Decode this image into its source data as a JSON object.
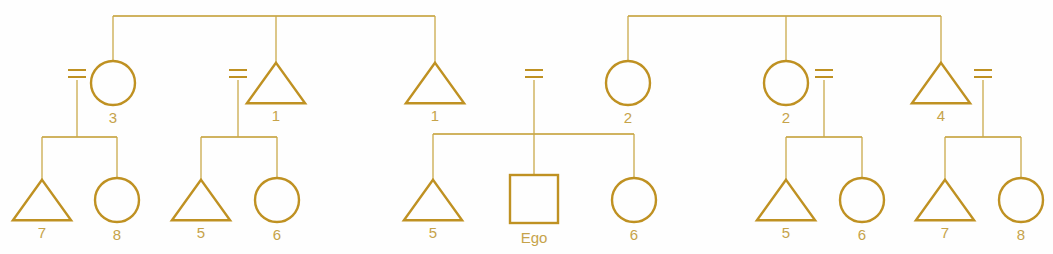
{
  "diagram": {
    "type": "kinship-diagram",
    "stroke_color": "#bf9122",
    "line_color": "#c19a2b",
    "label_color": "#c6a34a",
    "background_color": "#fefefe",
    "width": 1053,
    "height": 254
  },
  "symbols": {
    "male": "triangle",
    "female": "circle",
    "ego": "square",
    "marriage": "equals-sign"
  },
  "generation1": {
    "sibling_groups": [
      {
        "bar_y": 16,
        "bar_x1": 113,
        "bar_x2": 435,
        "members": [
          {
            "id": "g1-circle-3",
            "shape": "circle",
            "cx": 113,
            "cy": 83,
            "r": 22,
            "label": "3"
          },
          {
            "id": "g1-triangle-1a",
            "shape": "triangle",
            "cx": 276,
            "cy": 83,
            "r": 26,
            "label": "1"
          },
          {
            "id": "g1-triangle-1b",
            "shape": "triangle",
            "cx": 435,
            "cy": 83,
            "r": 26,
            "label": "1"
          }
        ]
      },
      {
        "bar_y": 16,
        "bar_x1": 628,
        "bar_x2": 941,
        "members": [
          {
            "id": "g1-circle-2a",
            "shape": "circle",
            "cx": 628,
            "cy": 83,
            "r": 22,
            "label": "2"
          },
          {
            "id": "g1-circle-2b",
            "shape": "circle",
            "cx": 786,
            "cy": 83,
            "r": 22,
            "label": "2"
          },
          {
            "id": "g1-triangle-4",
            "shape": "triangle",
            "cx": 941,
            "cy": 83,
            "r": 26,
            "label": "4"
          }
        ]
      }
    ]
  },
  "marriages": [
    {
      "id": "marriage-1",
      "x": 77,
      "y": 70,
      "half_width": 9,
      "gap": 7,
      "drop_to": 137
    },
    {
      "id": "marriage-2",
      "x": 238,
      "y": 70,
      "half_width": 9,
      "gap": 7,
      "drop_to": 137
    },
    {
      "id": "marriage-3",
      "x": 534,
      "y": 70,
      "half_width": 9,
      "gap": 7,
      "drop_to": 176
    },
    {
      "id": "marriage-4",
      "x": 824,
      "y": 70,
      "half_width": 9,
      "gap": 7,
      "drop_to": 137
    },
    {
      "id": "marriage-5",
      "x": 983,
      "y": 70,
      "half_width": 9,
      "gap": 7,
      "drop_to": 137
    }
  ],
  "generation2": {
    "sibling_groups": [
      {
        "id": "group-1",
        "bar_y": 137,
        "bar_x1": 42,
        "bar_x2": 117,
        "members": [
          {
            "id": "g2-triangle-7a",
            "shape": "triangle",
            "cx": 42,
            "cy": 200,
            "r": 26,
            "label": "7"
          },
          {
            "id": "g2-circle-8a",
            "shape": "circle",
            "cx": 117,
            "cy": 200,
            "r": 22,
            "label": "8"
          }
        ]
      },
      {
        "id": "group-2",
        "bar_y": 137,
        "bar_x1": 201,
        "bar_x2": 277,
        "members": [
          {
            "id": "g2-triangle-5a",
            "shape": "triangle",
            "cx": 201,
            "cy": 200,
            "r": 26,
            "label": "5"
          },
          {
            "id": "g2-circle-6a",
            "shape": "circle",
            "cx": 277,
            "cy": 200,
            "r": 22,
            "label": "6"
          }
        ]
      },
      {
        "id": "group-3",
        "bar_y": 134,
        "bar_x1": 433,
        "bar_x2": 634,
        "members": [
          {
            "id": "g2-triangle-5b",
            "shape": "triangle",
            "cx": 433,
            "cy": 200,
            "r": 26,
            "label": "5"
          },
          {
            "id": "g2-square-ego",
            "shape": "square",
            "cx": 534,
            "cy": 199,
            "r": 24,
            "label": "Ego"
          },
          {
            "id": "g2-circle-6b",
            "shape": "circle",
            "cx": 634,
            "cy": 200,
            "r": 22,
            "label": "6"
          }
        ]
      },
      {
        "id": "group-4",
        "bar_y": 137,
        "bar_x1": 786,
        "bar_x2": 862,
        "members": [
          {
            "id": "g2-triangle-5c",
            "shape": "triangle",
            "cx": 786,
            "cy": 200,
            "r": 26,
            "label": "5"
          },
          {
            "id": "g2-circle-6c",
            "shape": "circle",
            "cx": 862,
            "cy": 200,
            "r": 22,
            "label": "6"
          }
        ]
      },
      {
        "id": "group-5",
        "bar_y": 137,
        "bar_x1": 945,
        "bar_x2": 1021,
        "members": [
          {
            "id": "g2-triangle-7b",
            "shape": "triangle",
            "cx": 945,
            "cy": 200,
            "r": 26,
            "label": "7"
          },
          {
            "id": "g2-circle-8b",
            "shape": "circle",
            "cx": 1021,
            "cy": 200,
            "r": 22,
            "label": "8"
          }
        ]
      }
    ]
  },
  "all_labels": [
    "3",
    "1",
    "1",
    "2",
    "2",
    "4",
    "7",
    "8",
    "5",
    "6",
    "5",
    "Ego",
    "6",
    "5",
    "6",
    "7",
    "8"
  ]
}
